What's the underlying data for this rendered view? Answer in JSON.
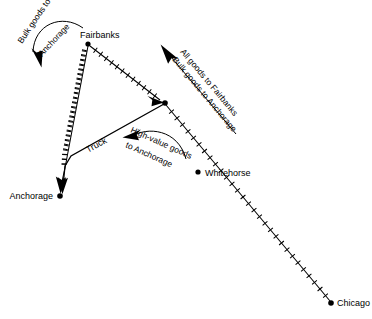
{
  "figure": {
    "background_color": "#ffffff",
    "ink_color": "#000000",
    "width": 372,
    "height": 319
  },
  "cities": [
    {
      "id": "fairbanks",
      "name": "Fairbanks",
      "x": 88,
      "y": 44,
      "label_x": 80,
      "label_y": 38,
      "label_anchor": "start"
    },
    {
      "id": "anchorage",
      "name": "Anchorage",
      "x": 60,
      "y": 196,
      "label_x": 52,
      "label_y": 199,
      "label_anchor": "end"
    },
    {
      "id": "whitehorse",
      "name": "Whitehorse",
      "x": 198,
      "y": 172,
      "label_x": 205,
      "label_y": 175,
      "label_anchor": "start"
    },
    {
      "id": "chicago",
      "name": "Chicago",
      "x": 331,
      "y": 303,
      "label_x": 337,
      "label_y": 306,
      "label_anchor": "start"
    }
  ],
  "junction": {
    "id": "junction",
    "x": 165,
    "y": 103
  },
  "mode_labels": [
    {
      "id": "truck",
      "text": "Truck",
      "x": 103,
      "y": 147,
      "rotation": -22
    }
  ],
  "flow_annotations": [
    {
      "id": "bulk-goods-to-anchorage-top",
      "lines": [
        "Bulk goods to",
        "Anchorage"
      ],
      "direction": "down",
      "arrow_tip_x": 43,
      "arrow_tip_y": 64
    },
    {
      "id": "all-goods-to-fairbanks-bulk-goods-to-anchorage",
      "lines": [
        "All goods to Fairbanks",
        "Bulk goods to Anchorage"
      ],
      "direction": "up-left",
      "arrow_tip_x": 162,
      "arrow_tip_y": 46
    },
    {
      "id": "high-value-goods-to-anchorage",
      "lines": [
        "High-value goods",
        "to Anchorage"
      ],
      "direction": "left",
      "arrow_tip_x": 124,
      "arrow_tip_y": 139
    }
  ],
  "routes": [
    {
      "id": "fairbanks-anchorage-rail",
      "style": "ticked",
      "from": "fairbanks",
      "to": "anchorage",
      "arrowhead": true
    },
    {
      "id": "fairbanks-junction-rail",
      "style": "ticked",
      "from": "fairbanks",
      "to": "junction",
      "arrowhead": true
    },
    {
      "id": "junction-whitehorse-chicago-rail",
      "style": "ticked",
      "from": "junction",
      "to": "chicago",
      "arrowhead": false
    },
    {
      "id": "junction-anchorage-truck",
      "style": "solid",
      "from": "junction",
      "to": "anchorage",
      "arrowhead": true
    }
  ]
}
